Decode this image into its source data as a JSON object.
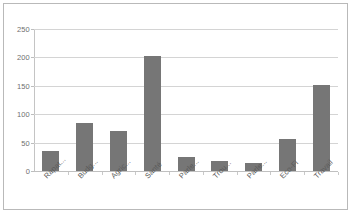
{
  "chart_data": {
    "type": "bar",
    "title": "",
    "xlabel": "",
    "ylabel": "",
    "ylim": [
      0,
      250
    ],
    "yticks": [
      0,
      50,
      100,
      150,
      200,
      250
    ],
    "grid": true,
    "legend": false,
    "bar_color": "#767676",
    "gridline_color": "#d4d4d4",
    "categories": [
      "Rapat...",
      "Budg...",
      "Agric...",
      "Santé",
      "Parle...",
      "Trou...",
      "Parle...",
      "Eco-Fi",
      "Travail"
    ],
    "values": [
      35,
      84,
      70,
      202,
      25,
      18,
      14,
      57,
      152
    ]
  },
  "axis": {
    "y_tick_labels": [
      "250",
      "200",
      "150",
      "100",
      "50",
      "0"
    ]
  }
}
